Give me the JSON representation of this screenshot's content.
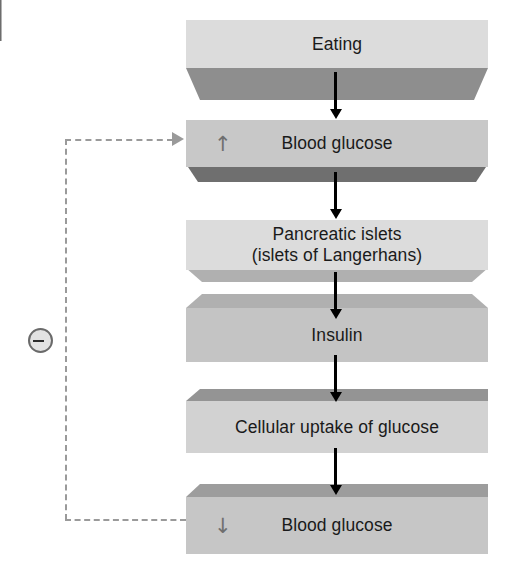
{
  "diagram": {
    "colors": {
      "slab_light": "#dcdcdc",
      "slab_mid": "#cacaca",
      "slab_dark_bevel": "#8e8e8e",
      "slab_soft_bevel": "#b4b4b4",
      "arrow_solid": "#000000",
      "arrow_dashed": "#9a9a9a",
      "text": "#1a1a1a",
      "delta_glyph": "#6f6f6f"
    },
    "nodes": [
      {
        "id": "eating",
        "label": "Eating",
        "label2": ""
      },
      {
        "id": "blood-glucose-high",
        "label": "Blood glucose",
        "label2": "",
        "indicator": "↑",
        "indicator_name": "up-arrow-icon"
      },
      {
        "id": "pancreatic-islets",
        "label": "Pancreatic islets",
        "label2": "(islets of Langerhans)"
      },
      {
        "id": "insulin",
        "label": "Insulin",
        "label2": ""
      },
      {
        "id": "cellular-uptake",
        "label": "Cellular uptake of glucose",
        "label2": ""
      },
      {
        "id": "blood-glucose-low",
        "label": "Blood glucose",
        "label2": "",
        "indicator": "↓",
        "indicator_name": "down-arrow-icon"
      }
    ],
    "feedback": {
      "sign": "−",
      "sign_name": "circled-minus-icon",
      "meaning": "negative feedback / inhibition",
      "from": "blood-glucose-low",
      "to": "blood-glucose-high"
    },
    "edges": [
      {
        "from": "eating",
        "to": "blood-glucose-high",
        "style": "solid"
      },
      {
        "from": "blood-glucose-high",
        "to": "pancreatic-islets",
        "style": "solid"
      },
      {
        "from": "pancreatic-islets",
        "to": "insulin",
        "style": "solid"
      },
      {
        "from": "insulin",
        "to": "cellular-uptake",
        "style": "solid"
      },
      {
        "from": "cellular-uptake",
        "to": "blood-glucose-low",
        "style": "solid"
      },
      {
        "from": "blood-glucose-low",
        "to": "blood-glucose-high",
        "style": "dashed"
      }
    ]
  }
}
